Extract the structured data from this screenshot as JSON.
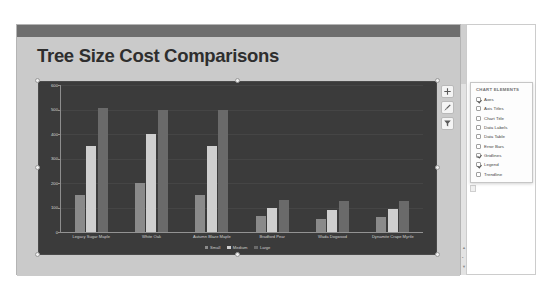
{
  "slide": {
    "title": "Tree Size Cost Comparisons"
  },
  "chart_buttons": [
    {
      "name": "chart-elements-button",
      "icon": "plus-icon",
      "label": "Chart Elements"
    },
    {
      "name": "chart-styles-button",
      "icon": "brush-icon",
      "label": "Chart Styles"
    },
    {
      "name": "chart-filters-button",
      "icon": "funnel-icon",
      "label": "Chart Filters"
    }
  ],
  "chart_elements_panel": {
    "title": "CHART ELEMENTS",
    "items": [
      {
        "label": "Axes",
        "checked": true
      },
      {
        "label": "Axis Titles",
        "checked": false
      },
      {
        "label": "Chart Title",
        "checked": false
      },
      {
        "label": "Data Labels",
        "checked": false
      },
      {
        "label": "Data Table",
        "checked": false
      },
      {
        "label": "Error Bars",
        "checked": false
      },
      {
        "label": "Gridlines",
        "checked": true
      },
      {
        "label": "Legend",
        "checked": true
      },
      {
        "label": "Trendline",
        "checked": false
      }
    ]
  },
  "colors": {
    "plot_background": "#3b3b3b",
    "slide_background": "#cacaca",
    "header_bar": "#6e6e6e",
    "series_small": "#8a8a8a",
    "series_medium": "#cfcfcf",
    "series_large": "#6a6a6a"
  },
  "chart_data": {
    "type": "bar",
    "title": "Tree Size Cost Comparisons",
    "xlabel": "",
    "ylabel": "",
    "ylim": [
      0,
      600
    ],
    "yticks": [
      0,
      100,
      200,
      300,
      400,
      500,
      600
    ],
    "grid": true,
    "legend_position": "bottom",
    "categories": [
      "Legacy Sugar Maple",
      "White Oak",
      "Autumn Blaze Maple",
      "Bradford Pear",
      "Wada Dogwood",
      "Dynamite Crape Myrtle"
    ],
    "series": [
      {
        "name": "Small",
        "color": "#8a8a8a",
        "values": [
          150,
          200,
          150,
          65,
          55,
          60
        ]
      },
      {
        "name": "Medium",
        "color": "#cfcfcf",
        "values": [
          350,
          400,
          350,
          100,
          90,
          95
        ]
      },
      {
        "name": "Large",
        "color": "#6a6a6a",
        "values": [
          505,
          500,
          500,
          130,
          125,
          125
        ]
      }
    ]
  }
}
